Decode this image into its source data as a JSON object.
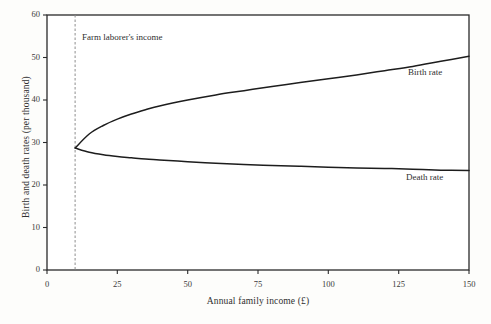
{
  "chart_data": {
    "type": "line",
    "title": "",
    "xlabel": "Annual family income (£)",
    "ylabel": "Birth and death rates (per thousand)",
    "xlim": [
      0,
      150
    ],
    "ylim": [
      0,
      60
    ],
    "xticks": [
      0,
      25,
      50,
      75,
      100,
      125,
      150
    ],
    "yticks": [
      0,
      10,
      20,
      30,
      40,
      50,
      60
    ],
    "xtick_labels": [
      "0",
      "25",
      "50",
      "75",
      "100",
      "125",
      "150"
    ],
    "ytick_labels": [
      "0",
      "10",
      "20",
      "30",
      "40",
      "50",
      "60"
    ],
    "grid": false,
    "legend_position": "inline-right",
    "series": [
      {
        "name": "Birth rate",
        "color": "#1d1d1d",
        "x": [
          10,
          15,
          20,
          25,
          30,
          35,
          40,
          50,
          60,
          70,
          80,
          90,
          100,
          110,
          120,
          130,
          140,
          150
        ],
        "values": [
          28.7,
          32.0,
          34.0,
          35.5,
          36.7,
          37.7,
          38.6,
          40.0,
          41.2,
          42.2,
          43.2,
          44.1,
          45.0,
          45.9,
          46.9,
          47.9,
          49.1,
          50.3
        ]
      },
      {
        "name": "Death rate",
        "color": "#1d1d1d",
        "x": [
          10,
          15,
          20,
          25,
          30,
          35,
          40,
          50,
          60,
          70,
          80,
          90,
          100,
          110,
          120,
          130,
          140,
          150
        ],
        "values": [
          28.7,
          27.7,
          27.1,
          26.7,
          26.4,
          26.1,
          25.9,
          25.5,
          25.1,
          24.8,
          24.6,
          24.4,
          24.2,
          24.0,
          23.9,
          23.7,
          23.5,
          23.4
        ]
      }
    ],
    "annotations": [
      {
        "name": "farm-laborer-income",
        "label": "Farm laborer's income",
        "x": 10,
        "style": "dashed-vertical-line"
      }
    ],
    "series_labels": [
      {
        "name": "Birth rate",
        "label": "Birth rate"
      },
      {
        "name": "Death rate",
        "label": "Death rate"
      }
    ]
  }
}
